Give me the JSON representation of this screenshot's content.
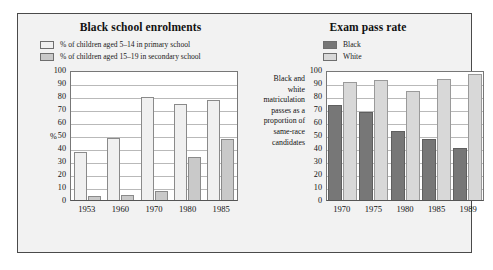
{
  "figure": {
    "panels": {
      "left": {
        "title": "Black school enrolments",
        "legend": [
          {
            "label": "% of children aged 5–14 in primary school",
            "swatch": "primary"
          },
          {
            "label": "% of children aged 15–19 in secondary school",
            "swatch": "secondary"
          }
        ],
        "axis_unit": "%"
      },
      "right": {
        "title": "Exam pass rate",
        "legend": [
          {
            "label": "Black",
            "swatch": "black"
          },
          {
            "label": "White",
            "swatch": "white"
          }
        ],
        "side_note": "Black and white matriculation passes as a proportion of same-race candidates"
      }
    }
  },
  "chart_data": [
    {
      "type": "bar",
      "title": "Black school enrolments",
      "categories": [
        "1953",
        "1960",
        "1970",
        "1980",
        "1985"
      ],
      "series": [
        {
          "name": "% of children aged 5–14 in primary school",
          "values": [
            37,
            48,
            79,
            74,
            77
          ],
          "color": "#f0f0f0"
        },
        {
          "name": "% of children aged 15–19 in secondary school",
          "values": [
            3,
            4,
            7,
            33,
            47
          ],
          "color": "#c9c9c9"
        }
      ],
      "xlabel": "",
      "ylabel": "%",
      "ylim": [
        0,
        100
      ],
      "yticks": [
        0,
        10,
        20,
        30,
        40,
        50,
        60,
        70,
        80,
        90,
        100
      ],
      "grid": true,
      "legend_position": "top"
    },
    {
      "type": "bar",
      "title": "Exam pass rate",
      "categories": [
        "1970",
        "1975",
        "1980",
        "1985",
        "1989"
      ],
      "series": [
        {
          "name": "Black",
          "values": [
            73,
            68,
            53,
            47,
            40
          ],
          "color": "#777777"
        },
        {
          "name": "White",
          "values": [
            91,
            92,
            84,
            93,
            97
          ],
          "color": "#d8d8d8"
        }
      ],
      "xlabel": "",
      "ylabel": "",
      "ylim": [
        0,
        100
      ],
      "yticks": [
        0,
        10,
        20,
        30,
        40,
        50,
        60,
        70,
        80,
        90,
        100
      ],
      "grid": true,
      "legend_position": "top",
      "annotation": "Black and white matriculation passes as a proportion of same-race candidates"
    }
  ]
}
